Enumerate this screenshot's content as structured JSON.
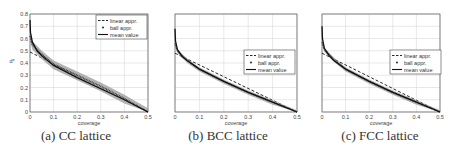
{
  "chart_data": [
    {
      "type": "line",
      "title": "(a) CC lattice",
      "xlabel": "coverage",
      "ylabel": "d*",
      "xlim": [
        0,
        0.5
      ],
      "ylim": [
        0,
        0.8
      ],
      "xticks": [
        "0",
        "0.1",
        "0.2",
        "0.3",
        "0.4",
        "0.5"
      ],
      "yticks": [
        "0",
        "0.1",
        "0.2",
        "0.3",
        "0.4",
        "0.5",
        "0.6",
        "0.7",
        "0.8"
      ],
      "grid": true,
      "legend_position": "upper right",
      "legend": [
        "linear appr.",
        "ball appr.",
        "mean value"
      ],
      "series": [
        {
          "name": "linear appr.",
          "style": "dashed",
          "x": [
            0,
            0.5
          ],
          "y": [
            0.49,
            0.0
          ]
        },
        {
          "name": "ball appr.",
          "style": "dots-band",
          "x": [
            0,
            0.01,
            0.05,
            0.1,
            0.2,
            0.3,
            0.4,
            0.5
          ],
          "y": [
            0.62,
            0.55,
            0.47,
            0.39,
            0.3,
            0.21,
            0.11,
            0.0
          ]
        },
        {
          "name": "mean value",
          "style": "solid",
          "x": [
            0,
            0.002,
            0.01,
            0.03,
            0.05,
            0.1,
            0.2,
            0.3,
            0.4,
            0.5
          ],
          "y": [
            0.75,
            0.65,
            0.57,
            0.5,
            0.46,
            0.38,
            0.28,
            0.19,
            0.1,
            0.0
          ]
        }
      ]
    },
    {
      "type": "line",
      "title": "(b) BCC lattice",
      "xlabel": "coverage",
      "ylabel": "",
      "xlim": [
        0,
        0.5
      ],
      "ylim": [
        0,
        0.8
      ],
      "xticks": [
        "0",
        "0.1",
        "0.2",
        "0.3",
        "0.4",
        "0.5"
      ],
      "grid": true,
      "legend_position": "center right",
      "legend": [
        "linear appr.",
        "ball appr.",
        "mean value"
      ],
      "series": [
        {
          "name": "linear appr.",
          "style": "dashed",
          "x": [
            0,
            0.5
          ],
          "y": [
            0.48,
            0.0
          ]
        },
        {
          "name": "ball appr.",
          "style": "dots-band",
          "x": [
            0,
            0.01,
            0.05,
            0.1,
            0.2,
            0.3,
            0.4,
            0.5
          ],
          "y": [
            0.56,
            0.5,
            0.42,
            0.35,
            0.25,
            0.16,
            0.08,
            0.0
          ]
        },
        {
          "name": "mean value",
          "style": "solid",
          "x": [
            0,
            0.002,
            0.01,
            0.03,
            0.05,
            0.1,
            0.2,
            0.3,
            0.4,
            0.5
          ],
          "y": [
            0.68,
            0.58,
            0.51,
            0.45,
            0.42,
            0.35,
            0.25,
            0.16,
            0.08,
            0.0
          ]
        }
      ]
    },
    {
      "type": "line",
      "title": "(c) FCC lattice",
      "xlabel": "coverage",
      "ylabel": "",
      "xlim": [
        0,
        0.5
      ],
      "ylim": [
        0,
        0.8
      ],
      "xticks": [
        "0",
        "0.1",
        "0.2",
        "0.3",
        "0.4",
        "0.5"
      ],
      "grid": true,
      "legend_position": "center right",
      "legend": [
        "linear appr.",
        "ball appr.",
        "mean value"
      ],
      "series": [
        {
          "name": "linear appr.",
          "style": "dashed",
          "x": [
            0,
            0.5
          ],
          "y": [
            0.48,
            0.0
          ]
        },
        {
          "name": "ball appr.",
          "style": "dots-band",
          "x": [
            0,
            0.01,
            0.05,
            0.1,
            0.2,
            0.3,
            0.4,
            0.5
          ],
          "y": [
            0.57,
            0.51,
            0.43,
            0.35,
            0.25,
            0.16,
            0.08,
            0.0
          ]
        },
        {
          "name": "mean value",
          "style": "solid",
          "x": [
            0,
            0.002,
            0.01,
            0.03,
            0.05,
            0.1,
            0.2,
            0.3,
            0.4,
            0.5
          ],
          "y": [
            0.7,
            0.6,
            0.52,
            0.46,
            0.42,
            0.35,
            0.25,
            0.16,
            0.08,
            0.0
          ]
        }
      ]
    }
  ],
  "captions": [
    "(a) CC lattice",
    "(b) BCC lattice",
    "(c) FCC lattice"
  ],
  "colors": {
    "curve": "#111111",
    "band": "#9a9a9a",
    "grid": "#d8d8d8",
    "axis": "#555555"
  }
}
